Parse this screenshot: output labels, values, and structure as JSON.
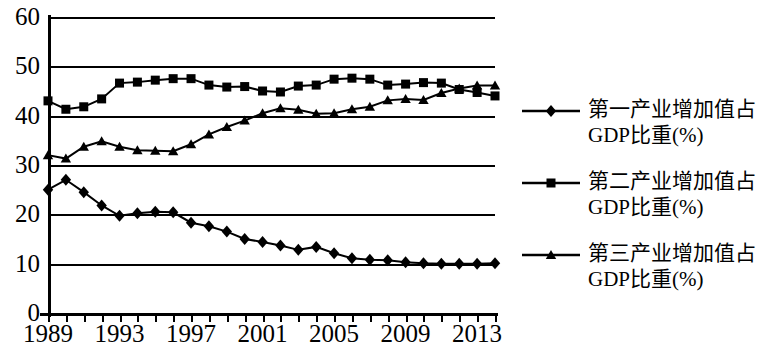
{
  "chart_data": {
    "type": "line",
    "title": "",
    "subtitle": "",
    "xlabel": "",
    "ylabel": "",
    "xlim": [
      1989,
      2014
    ],
    "ylim": [
      0,
      60
    ],
    "grid": true,
    "legend_position": "right",
    "y_ticks": [
      0,
      10,
      20,
      30,
      40,
      50,
      60
    ],
    "y_tick_labels": [
      "0",
      "10",
      "20",
      "30",
      "40",
      "50",
      "60"
    ],
    "x": [
      1989,
      1990,
      1991,
      1992,
      1993,
      1994,
      1995,
      1996,
      1997,
      1998,
      1999,
      2000,
      2001,
      2002,
      2003,
      2004,
      2005,
      2006,
      2007,
      2008,
      2009,
      2010,
      2011,
      2012,
      2013,
      2014
    ],
    "x_tick_labels": [
      "1989",
      "1993",
      "1997",
      "2001",
      "2005",
      "2009",
      "2013"
    ],
    "x_tick_label_values": [
      1989,
      1993,
      1997,
      2001,
      2005,
      2009,
      2013
    ],
    "series": [
      {
        "name": "第一产业增加值占GDP比重(%)",
        "marker": "diamond",
        "color": "#000000",
        "values": [
          25.0,
          27.0,
          24.5,
          21.8,
          19.7,
          20.2,
          20.5,
          20.4,
          18.3,
          17.6,
          16.5,
          15.0,
          14.4,
          13.7,
          12.8,
          13.4,
          12.1,
          11.1,
          10.8,
          10.7,
          10.3,
          10.1,
          10.0,
          10.0,
          10.0,
          10.1
        ]
      },
      {
        "name": "第二产业增加值占GDP比重(%)",
        "marker": "square",
        "color": "#000000",
        "values": [
          43.0,
          41.3,
          41.8,
          43.4,
          46.6,
          46.8,
          47.2,
          47.5,
          47.5,
          46.2,
          45.8,
          45.9,
          45.0,
          44.8,
          46.0,
          46.2,
          47.4,
          47.6,
          47.4,
          46.2,
          46.4,
          46.7,
          46.6,
          45.3,
          44.7,
          44.0
        ]
      },
      {
        "name": "第三产业增加值占GDP比重(%)",
        "marker": "triangle",
        "color": "#000000",
        "values": [
          32.0,
          31.3,
          33.7,
          34.8,
          33.7,
          33.0,
          32.9,
          32.8,
          34.2,
          36.2,
          37.7,
          39.0,
          40.5,
          41.5,
          41.2,
          40.4,
          40.5,
          41.3,
          41.8,
          43.1,
          43.4,
          43.2,
          44.6,
          45.5,
          46.1,
          46.1
        ]
      }
    ]
  },
  "legend": {
    "entries": [
      {
        "label": "第一产业增加值占\nGDP比重(%)",
        "marker": "diamond-marker-icon"
      },
      {
        "label": "第二产业增加值占\nGDP比重(%)",
        "marker": "square-marker-icon"
      },
      {
        "label": "第三产业增加值占\nGDP比重(%)",
        "marker": "triangle-marker-icon"
      }
    ]
  }
}
